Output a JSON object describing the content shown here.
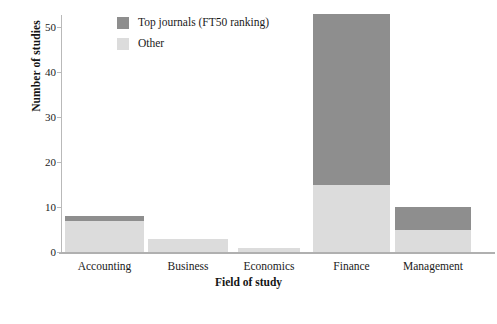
{
  "chart_data": {
    "type": "bar",
    "subtype": "stacked-bar",
    "title": "",
    "xlabel": "Field of study",
    "ylabel": "Number of studies",
    "categories": [
      "Accounting",
      "Business",
      "Economics",
      "Finance",
      "Management"
    ],
    "series": [
      {
        "name": "Top journals (FT50 ranking)",
        "color": "#8e8e8e",
        "values": [
          1,
          0,
          0,
          38,
          5
        ]
      },
      {
        "name": "Other",
        "color": "#dcdcdc",
        "values": [
          7,
          3,
          1,
          15,
          5
        ]
      }
    ],
    "totals": [
      8,
      3,
      1,
      53,
      10
    ],
    "ylim": [
      0,
      53
    ],
    "yticks": [
      0,
      10,
      20,
      30,
      40,
      50
    ],
    "ytick_labels": [
      "0",
      "10",
      "20",
      "30",
      "40",
      "50"
    ],
    "grid": false,
    "legend_position": "top-center-left",
    "stack_order": "Other at bottom, Top journals on top"
  },
  "axes": {
    "y_title": "Number of studies",
    "x_title": "Field of study"
  },
  "legend": {
    "items": [
      {
        "label": "Top journals (FT50 ranking)",
        "color": "#8e8e8e"
      },
      {
        "label": "Other",
        "color": "#dcdcdc"
      }
    ]
  }
}
